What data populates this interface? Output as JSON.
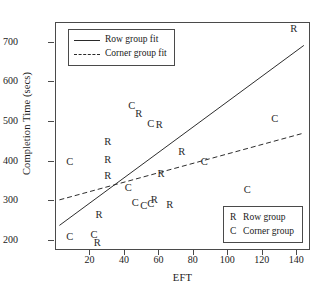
{
  "chart_data": {
    "type": "scatter",
    "title": "",
    "xlabel": "EFT",
    "ylabel": "Completion Time (secs)",
    "xlim": [
      0,
      148
    ],
    "ylim": [
      175,
      750
    ],
    "xticks": [
      20,
      40,
      60,
      80,
      100,
      120,
      140
    ],
    "yticks": [
      200,
      300,
      400,
      500,
      600,
      700
    ],
    "grid": false,
    "marker_style": "text-letter",
    "series": [
      {
        "name": "Row group",
        "marker": "R",
        "points": [
          {
            "x": 24,
            "y": 195
          },
          {
            "x": 25,
            "y": 265
          },
          {
            "x": 30,
            "y": 365
          },
          {
            "x": 30,
            "y": 405
          },
          {
            "x": 30,
            "y": 450
          },
          {
            "x": 48,
            "y": 520
          },
          {
            "x": 57,
            "y": 303
          },
          {
            "x": 60,
            "y": 493
          },
          {
            "x": 61,
            "y": 370
          },
          {
            "x": 66,
            "y": 290
          },
          {
            "x": 73,
            "y": 425
          },
          {
            "x": 138,
            "y": 735
          }
        ]
      },
      {
        "name": "Corner group",
        "marker": "C",
        "points": [
          {
            "x": 8,
            "y": 210
          },
          {
            "x": 8,
            "y": 400
          },
          {
            "x": 22,
            "y": 215
          },
          {
            "x": 42,
            "y": 335
          },
          {
            "x": 44,
            "y": 540
          },
          {
            "x": 46,
            "y": 295
          },
          {
            "x": 51,
            "y": 288
          },
          {
            "x": 55,
            "y": 293
          },
          {
            "x": 55,
            "y": 495
          },
          {
            "x": 86,
            "y": 400
          },
          {
            "x": 111,
            "y": 330
          },
          {
            "x": 127,
            "y": 508
          }
        ]
      }
    ],
    "fit_lines": [
      {
        "name": "Row group fit",
        "style": "solid",
        "x0": 2,
        "y0": 235,
        "x1": 145,
        "y1": 693
      },
      {
        "name": "Corner group fit",
        "style": "dashed",
        "x0": 2,
        "y0": 300,
        "x1": 145,
        "y1": 470
      }
    ],
    "legend_position": "top-left and bottom-right"
  },
  "line_legend": {
    "row_fit_label": "Row group fit",
    "corner_fit_label": "Corner group fit"
  },
  "group_legend": {
    "row_key": "R",
    "row_label": "Row group",
    "corner_key": "C",
    "corner_label": "Corner group"
  }
}
